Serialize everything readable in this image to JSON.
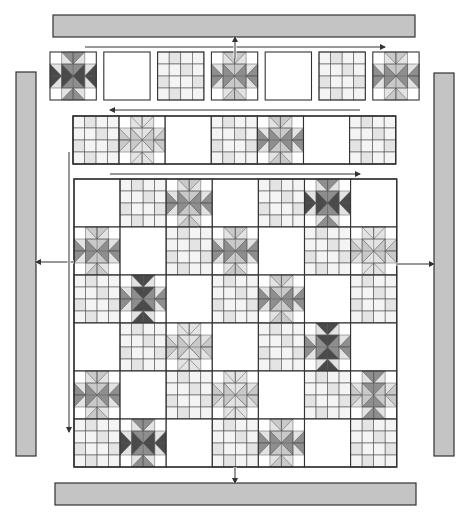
{
  "diagram": {
    "colors": {
      "background": "#ffffff",
      "border_strip": "#c4c4c4",
      "outline": "#333333",
      "grid_line": "#555555",
      "star_dark": "#4a4a4a",
      "star_medium": "#8e8e8e",
      "star_light": "#c9c9c9",
      "star_pale": "#e3e3e3",
      "grid_fill_a": "#f4f4f4",
      "grid_fill_b": "#e4e4e4",
      "arrow": "#333333"
    },
    "border_strips": {
      "top": {
        "x": 53,
        "y": 15,
        "w": 362,
        "h": 22
      },
      "bottom": {
        "x": 55,
        "y": 483,
        "w": 361,
        "h": 22
      },
      "left": {
        "x": 16,
        "y": 72,
        "w": 20,
        "h": 384
      },
      "right": {
        "x": 434,
        "y": 73,
        "w": 20,
        "h": 383
      }
    },
    "rows": [
      {
        "name": "row-1",
        "x": 50,
        "y": 52,
        "block_w": 46.3,
        "block_h": 48,
        "gap": 7.5,
        "separate": true,
        "direction_arrow": {
          "x1": 85,
          "x2": 385,
          "y": 47,
          "dir": "right"
        },
        "blocks": [
          "star-dark",
          "plain",
          "grid",
          "star-medium",
          "plain",
          "grid",
          "star-medium"
        ]
      },
      {
        "name": "row-2",
        "x": 73,
        "y": 116,
        "block_w": 46.1,
        "block_h": 48,
        "gap": 0,
        "separate": false,
        "direction_arrow": {
          "x1": 110,
          "x2": 360,
          "y": 110,
          "dir": "left"
        },
        "blocks": [
          "grid",
          "star-light",
          "plain",
          "grid",
          "star-medium",
          "plain",
          "grid"
        ]
      }
    ],
    "main_grid": {
      "x": 74,
      "y": 179,
      "cols": 7,
      "rows": 6,
      "block_w": 46.1,
      "block_h": 48,
      "direction_arrow": {
        "x1": 110,
        "x2": 360,
        "y": 174,
        "dir": "right"
      },
      "cells": [
        [
          "plain",
          "grid",
          "star-medium",
          "plain",
          "grid",
          "star-dark",
          "plain"
        ],
        [
          "star-medium",
          "plain",
          "grid",
          "star-medium",
          "plain",
          "grid",
          "star-light"
        ],
        [
          "grid",
          "star-dark-v",
          "plain",
          "grid",
          "star-medium",
          "plain",
          "grid"
        ],
        [
          "plain",
          "grid",
          "star-light",
          "plain",
          "grid",
          "star-dark-v",
          "plain"
        ],
        [
          "star-medium",
          "plain",
          "grid",
          "star-light",
          "plain",
          "grid",
          "star-medium-v"
        ],
        [
          "grid",
          "star-dark",
          "plain",
          "grid",
          "star-medium",
          "plain",
          "grid"
        ]
      ]
    },
    "arrows": [
      {
        "name": "top-border-join-arrow",
        "x1": 235,
        "y1": 58,
        "x2": 235,
        "y2": 37,
        "dir": "up"
      },
      {
        "name": "bottom-border-join-arrow",
        "x1": 235,
        "y1": 467,
        "x2": 235,
        "y2": 483,
        "dir": "down"
      },
      {
        "name": "left-border-join-arrow",
        "x1": 74,
        "y1": 262,
        "x2": 36,
        "y2": 262,
        "dir": "left"
      },
      {
        "name": "right-border-join-arrow",
        "x1": 396,
        "y1": 264,
        "x2": 434,
        "y2": 264,
        "dir": "right"
      },
      {
        "name": "rows-downward-arrow",
        "x1": 69,
        "y1": 152,
        "x2": 69,
        "y2": 432,
        "dir": "down"
      }
    ],
    "legend": {
      "block_types": [
        "star-dark",
        "star-medium",
        "star-light",
        "grid",
        "plain"
      ]
    }
  }
}
